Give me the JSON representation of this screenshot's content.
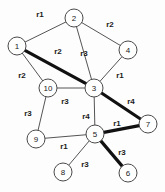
{
  "figure": {
    "background_color": "#fdfdfd",
    "node_fill": "#ffffff",
    "node_stroke": "#4a4a4a",
    "edge_color": "#555555",
    "highlight_color": "#111111"
  },
  "chart_data": {
    "type": "diagram",
    "title": "",
    "nodes": [
      {
        "id": "1",
        "label": "1",
        "x": 17,
        "y": 46,
        "r": 9
      },
      {
        "id": "2",
        "label": "2",
        "x": 74,
        "y": 18,
        "r": 9
      },
      {
        "id": "3",
        "label": "3",
        "x": 94,
        "y": 88,
        "r": 9
      },
      {
        "id": "4",
        "label": "4",
        "x": 128,
        "y": 50,
        "r": 9
      },
      {
        "id": "5",
        "label": "5",
        "x": 95,
        "y": 134,
        "r": 9
      },
      {
        "id": "6",
        "label": "6",
        "x": 128,
        "y": 173,
        "r": 9
      },
      {
        "id": "7",
        "label": "7",
        "x": 148,
        "y": 124,
        "r": 9
      },
      {
        "id": "8",
        "label": "8",
        "x": 63,
        "y": 172,
        "r": 9
      },
      {
        "id": "9",
        "label": "9",
        "x": 36,
        "y": 139,
        "r": 9
      },
      {
        "id": "10",
        "label": "10",
        "x": 48,
        "y": 88,
        "r": 9
      }
    ],
    "edges": [
      {
        "from": "1",
        "to": "2",
        "label": "r1",
        "lx": 40,
        "ly": 14,
        "highlighted": false
      },
      {
        "from": "2",
        "to": "4",
        "label": "r2",
        "lx": 110,
        "ly": 24,
        "highlighted": false
      },
      {
        "from": "2",
        "to": "3",
        "label": "r3",
        "lx": 84,
        "ly": 53,
        "highlighted": false
      },
      {
        "from": "1",
        "to": "3",
        "label": "r2",
        "lx": 58,
        "ly": 51,
        "highlighted": true
      },
      {
        "from": "1",
        "to": "10",
        "label": "r2",
        "lx": 22,
        "ly": 75,
        "highlighted": false
      },
      {
        "from": "4",
        "to": "3",
        "label": "r1",
        "lx": 120,
        "ly": 75,
        "highlighted": false
      },
      {
        "from": "3",
        "to": "10",
        "label": "r3",
        "lx": 65,
        "ly": 101,
        "highlighted": false
      },
      {
        "from": "3",
        "to": "5",
        "label": "r4",
        "lx": 86,
        "ly": 116,
        "highlighted": false
      },
      {
        "from": "3",
        "to": "7",
        "label": "r4",
        "lx": 131,
        "ly": 101,
        "highlighted": true
      },
      {
        "from": "9",
        "to": "10",
        "label": "r3",
        "lx": 28,
        "ly": 113,
        "highlighted": false
      },
      {
        "from": "9",
        "to": "5",
        "label": "r1",
        "lx": 64,
        "ly": 146,
        "highlighted": false
      },
      {
        "from": "5",
        "to": "7",
        "label": "r1",
        "lx": 117,
        "ly": 123,
        "highlighted": true
      },
      {
        "from": "5",
        "to": "6",
        "label": "r3",
        "lx": 122,
        "ly": 152,
        "highlighted": true
      },
      {
        "from": "5",
        "to": "8",
        "label": "r3",
        "lx": 85,
        "ly": 164,
        "highlighted": false
      }
    ],
    "edge_weight_labels": [
      "r1",
      "r2",
      "r3",
      "r4"
    ],
    "highlighted_path": [
      "1",
      "3",
      "7",
      "5",
      "6"
    ],
    "node_count": 10,
    "edge_count": 14
  }
}
